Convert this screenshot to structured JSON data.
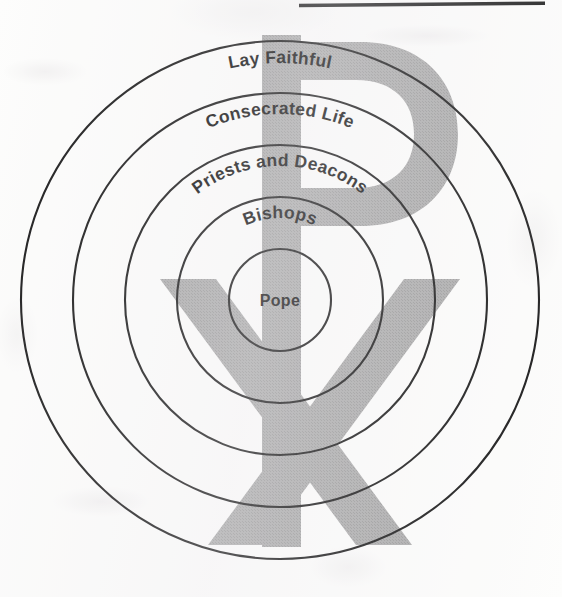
{
  "diagram": {
    "type": "concentric-rings",
    "center": {
      "x": 280,
      "y": 300
    },
    "background_symbol": {
      "name": "chi-rho-icon",
      "label": "Chi-Rho",
      "color": "#a9a9a9"
    },
    "ring_stroke_color": "#1a1a1a",
    "rings": [
      {
        "id": "ring-lay-faithful",
        "label": "Lay Faithful",
        "order": 5,
        "radius": 259,
        "label_radius": 237,
        "arched": true,
        "font_size": 17.5
      },
      {
        "id": "ring-consecrated-life",
        "label": "Consecrated Life",
        "order": 4,
        "radius": 207,
        "label_radius": 186,
        "arched": true,
        "font_size": 17.5
      },
      {
        "id": "ring-priests-and-deacons",
        "label": "Priests and Deacons",
        "order": 3,
        "radius": 155,
        "label_radius": 134,
        "arched": true,
        "font_size": 17.5
      },
      {
        "id": "ring-bishops",
        "label": "Bishops",
        "order": 2,
        "radius": 103,
        "label_radius": 82,
        "arched": true,
        "font_size": 17.5
      },
      {
        "id": "ring-pope",
        "label": "Pope",
        "order": 1,
        "radius": 51,
        "label_radius": 0,
        "arched": false,
        "font_size": 16
      }
    ],
    "page_edge_line": {
      "name": "scan-edge-line",
      "color": "#1f1f1f"
    }
  }
}
